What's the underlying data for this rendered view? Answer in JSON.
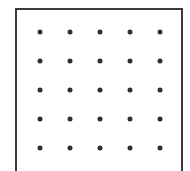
{
  "diagram": {
    "type": "dot-grid",
    "rows": 5,
    "columns": 5,
    "dot_color": "#2e2e2e",
    "frame_color": "#3a3a3a",
    "column_x": [
      40,
      70,
      100,
      130,
      160
    ],
    "row_y": [
      32,
      61,
      90,
      119,
      148
    ]
  }
}
